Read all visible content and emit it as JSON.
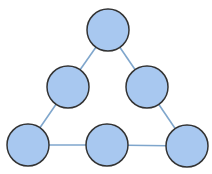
{
  "diagram": {
    "type": "graph",
    "node_fill": "#a8c8f0",
    "node_stroke": "#333333",
    "edge_color": "#7fa6cc",
    "radius": 21,
    "nodes": [
      {
        "id": "top",
        "x": 108,
        "y": 30
      },
      {
        "id": "mid-left",
        "x": 68,
        "y": 87
      },
      {
        "id": "mid-right",
        "x": 147,
        "y": 87
      },
      {
        "id": "bottom-left",
        "x": 28,
        "y": 145
      },
      {
        "id": "bottom-mid",
        "x": 107,
        "y": 145
      },
      {
        "id": "bottom-right",
        "x": 187,
        "y": 146
      }
    ],
    "edges": [
      [
        "top",
        "mid-left"
      ],
      [
        "top",
        "mid-right"
      ],
      [
        "mid-left",
        "bottom-left"
      ],
      [
        "mid-right",
        "bottom-right"
      ],
      [
        "bottom-left",
        "bottom-mid"
      ],
      [
        "bottom-mid",
        "bottom-right"
      ]
    ]
  }
}
